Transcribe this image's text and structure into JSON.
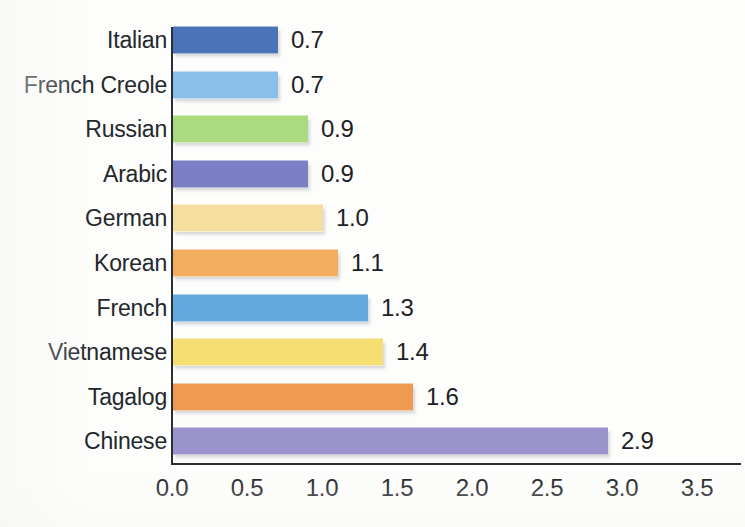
{
  "chart_data": {
    "type": "bar",
    "orientation": "horizontal",
    "title": "",
    "subtitle": "",
    "xlabel": "",
    "ylabel": "",
    "categories": [
      "Italian",
      "French Creole",
      "Russian",
      "Arabic",
      "German",
      "Korean",
      "French",
      "Vietnamese",
      "Tagalog",
      "Chinese"
    ],
    "values": [
      0.7,
      0.7,
      0.9,
      0.9,
      1.0,
      1.1,
      1.3,
      1.4,
      1.6,
      2.9
    ],
    "value_labels": [
      "0.7",
      "0.7",
      "0.9",
      "0.9",
      "1.0",
      "1.1",
      "1.3",
      "1.4",
      "1.6",
      "2.9"
    ],
    "bar_colors": [
      "#4a74b8",
      "#89bfe8",
      "#aadb7e",
      "#7b7fc4",
      "#f5dfa0",
      "#f2ae5e",
      "#62a9de",
      "#f5de72",
      "#ef9a52",
      "#9b93cc"
    ],
    "xlim": [
      0.0,
      3.5
    ],
    "xticks": [
      0.0,
      0.5,
      1.0,
      1.5,
      2.0,
      2.5,
      3.0,
      3.5
    ],
    "xtick_labels": [
      "0.0",
      "0.5",
      "1.0",
      "1.5",
      "2.0",
      "2.5",
      "3.0",
      "3.5"
    ],
    "grid": false,
    "legend": "none",
    "data_labels_position": "outside-end"
  },
  "axis": {
    "axis_color": "#2b2f33"
  },
  "rows": [
    {
      "label": "Italian",
      "value_label": "0.7",
      "value": 0.7,
      "color": "#4a74b8"
    },
    {
      "label": "French Creole",
      "value_label": "0.7",
      "value": 0.7,
      "color": "#89bfe8"
    },
    {
      "label": "Russian",
      "value_label": "0.9",
      "value": 0.9,
      "color": "#aadb7e"
    },
    {
      "label": "Arabic",
      "value_label": "0.9",
      "value": 0.9,
      "color": "#7b7fc4"
    },
    {
      "label": "German",
      "value_label": "1.0",
      "value": 1.0,
      "color": "#f5dfa0"
    },
    {
      "label": "Korean",
      "value_label": "1.1",
      "value": 1.1,
      "color": "#f2ae5e"
    },
    {
      "label": "French",
      "value_label": "1.3",
      "value": 1.3,
      "color": "#62a9de"
    },
    {
      "label": "Vietnamese",
      "value_label": "1.4",
      "value": 1.4,
      "color": "#f5de72"
    },
    {
      "label": "Tagalog",
      "value_label": "1.6",
      "value": 1.6,
      "color": "#ef9a52"
    },
    {
      "label": "Chinese",
      "value_label": "2.9",
      "value": 2.9,
      "color": "#9b93cc"
    }
  ],
  "xticks": [
    {
      "label": "0.0",
      "value": 0.0
    },
    {
      "label": "0.5",
      "value": 0.5
    },
    {
      "label": "1.0",
      "value": 1.0
    },
    {
      "label": "1.5",
      "value": 1.5
    },
    {
      "label": "2.0",
      "value": 2.0
    },
    {
      "label": "2.5",
      "value": 2.5
    },
    {
      "label": "3.0",
      "value": 3.0
    },
    {
      "label": "3.5",
      "value": 3.5
    }
  ]
}
